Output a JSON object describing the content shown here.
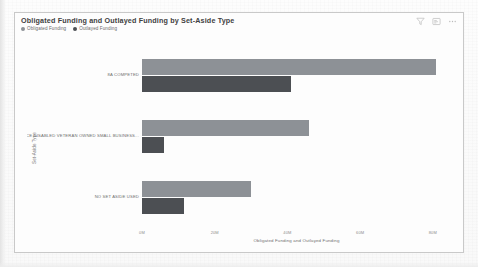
{
  "card": {
    "title": "Obligated Funding and Outlayed Funding by Set-Aside Type",
    "actions": [
      {
        "name": "filter-icon",
        "label": "Filters"
      },
      {
        "name": "focus-mode-icon",
        "label": "Focus mode"
      },
      {
        "name": "more-options-icon",
        "label": "More options"
      }
    ]
  },
  "colors": {
    "obligated": "#8d9196",
    "outlayed": "#4c4f53",
    "card_border": "#c9c9c9",
    "card_background": "#fdfdfd",
    "axis_text": "#707070"
  },
  "chart_data": {
    "type": "bar",
    "orientation": "horizontal",
    "grouping": "grouped",
    "title": "Obligated Funding and Outlayed Funding by Set-Aside Type",
    "xlabel": "Obligated Funding and Outlayed Funding",
    "ylabel": "Set-Aside Type",
    "categories": [
      "8A COMPETED",
      "SERVICE DISABLED VETERAN OWNED SMALL BUSINESS...",
      "NO SET ASIDE USED"
    ],
    "series": [
      {
        "name": "Obligated Funding",
        "color": "#8d9196",
        "values": [
          81,
          46,
          30
        ]
      },
      {
        "name": "Outlayed Funding",
        "color": "#4c4f53",
        "values": [
          41,
          6,
          11.5
        ]
      }
    ],
    "xlim": [
      0,
      85
    ],
    "xticks": [
      0,
      20,
      40,
      60,
      80
    ],
    "xtick_labels": [
      "0M",
      "20M",
      "40M",
      "60M",
      "80M"
    ],
    "value_unit": "M",
    "grid": false,
    "legend_position": "top-left"
  }
}
